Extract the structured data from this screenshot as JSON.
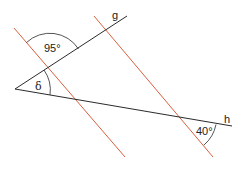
{
  "diagram": {
    "colors": {
      "black_lines": "#2a2a2a",
      "red_lines": "#d9603f",
      "background": "#ffffff"
    },
    "vertex": {
      "x": 15,
      "y": 89
    },
    "lines": {
      "g": {
        "label": "g",
        "x1": 15,
        "y1": 89,
        "x2": 127,
        "y2": 16
      },
      "h": {
        "label": "h",
        "x1": 15,
        "y1": 89,
        "x2": 232,
        "y2": 126
      },
      "parallel_1": {
        "x1": 14,
        "y1": 28,
        "x2": 125,
        "y2": 157
      },
      "parallel_2": {
        "x1": 94,
        "y1": 16,
        "x2": 213,
        "y2": 157
      }
    },
    "angles": {
      "top": {
        "label": "95°"
      },
      "vertex": {
        "label": "δ"
      },
      "bottom_right": {
        "label": "40°"
      }
    }
  }
}
